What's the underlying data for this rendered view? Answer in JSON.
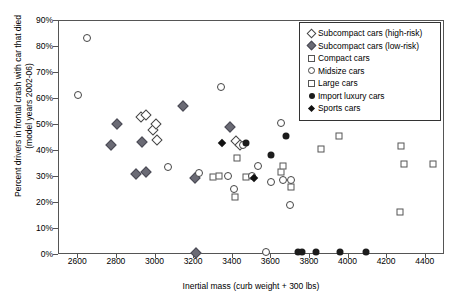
{
  "chart_data": {
    "type": "scatter",
    "title": "",
    "xlabel": "Inertial mass (curb weight + 300 lbs)",
    "ylabel": "Percent drivers in frontal crash with car that died\n(model years 2002-06)",
    "xlim": [
      2500,
      4500
    ],
    "ylim": [
      0,
      0.9
    ],
    "grid": false,
    "legend_position": "top-right",
    "xticks": [
      "2600",
      "2800",
      "3000",
      "3200",
      "3400",
      "3600",
      "3800",
      "4000",
      "4200",
      "4400"
    ],
    "xtick_values": [
      2600,
      2800,
      3000,
      3200,
      3400,
      3600,
      3800,
      4000,
      4200,
      4400
    ],
    "yticks": [
      "0%",
      "10%",
      "20%",
      "30%",
      "40%",
      "50%",
      "60%",
      "70%",
      "80%",
      "90%"
    ],
    "ytick_values": [
      0,
      10,
      20,
      30,
      40,
      50,
      60,
      70,
      80,
      90
    ],
    "series": [
      {
        "name": "Subcompact cars (high-risk)",
        "marker": "open-diamond",
        "marker_class": "m-odia",
        "legend_class": "s-odia",
        "points": [
          [
            2925,
            53.0
          ],
          [
            2950,
            54.0
          ],
          [
            2985,
            48.0
          ],
          [
            3000,
            50.3
          ],
          [
            3010,
            44.3
          ],
          [
            3415,
            43.8
          ],
          [
            3440,
            42.2
          ]
        ]
      },
      {
        "name": "Subcompact cars (low-risk)",
        "marker": "filled-diamond-gray",
        "marker_class": "m-fdia",
        "legend_class": "s-fdia",
        "points": [
          [
            2770,
            42.5
          ],
          [
            2800,
            50.2
          ],
          [
            2900,
            31.2
          ],
          [
            2930,
            43.4
          ],
          [
            2950,
            31.8
          ],
          [
            3140,
            57.2
          ],
          [
            3205,
            29.8
          ],
          [
            3385,
            49.4
          ],
          [
            3210,
            0.7
          ]
        ]
      },
      {
        "name": "Compact cars",
        "marker": "open-square-small",
        "marker_class": "m-sqs",
        "legend_class": "s-sq",
        "points": [
          [
            3300,
            30.0
          ],
          [
            3330,
            30.3
          ],
          [
            3410,
            22.5
          ],
          [
            3420,
            37.2
          ],
          [
            3470,
            30.1
          ],
          [
            3650,
            31.8
          ],
          [
            3660,
            34.3
          ],
          [
            3700,
            26.0
          ]
        ]
      },
      {
        "name": "Midsize cars",
        "marker": "open-circle",
        "marker_class": "m-ocir",
        "legend_class": "s-ocir",
        "points": [
          [
            2645,
            83.4
          ],
          [
            2600,
            61.5
          ],
          [
            3065,
            33.8
          ],
          [
            3225,
            31.5
          ],
          [
            3340,
            64.8
          ],
          [
            3375,
            30.5
          ],
          [
            3405,
            25.4
          ],
          [
            3455,
            42.5
          ],
          [
            3530,
            34.2
          ],
          [
            3600,
            27.9
          ],
          [
            3650,
            50.9
          ],
          [
            3660,
            28.7
          ],
          [
            3700,
            28.8
          ],
          [
            3695,
            19.4
          ],
          [
            3570,
            1.0
          ],
          [
            3500,
            30.2
          ]
        ]
      },
      {
        "name": "Large cars",
        "marker": "open-square",
        "marker_class": "m-sql",
        "legend_class": "s-sq",
        "points": [
          [
            3860,
            40.6
          ],
          [
            3950,
            45.9
          ],
          [
            4270,
            41.8
          ],
          [
            4290,
            34.9
          ],
          [
            4440,
            34.9
          ],
          [
            4265,
            16.5
          ]
        ]
      },
      {
        "name": "Import luxury cars",
        "marker": "filled-circle",
        "marker_class": "m-fcir",
        "legend_class": "s-fcir",
        "points": [
          [
            3470,
            43.0
          ],
          [
            3600,
            38.5
          ],
          [
            3675,
            45.6
          ],
          [
            3740,
            1.0
          ],
          [
            3830,
            1.0
          ],
          [
            3955,
            1.0
          ],
          [
            4090,
            1.0
          ],
          [
            3760,
            1.0
          ]
        ]
      },
      {
        "name": "Sports cars",
        "marker": "filled-diamond",
        "marker_class": "m-spdia",
        "legend_class": "s-spdia",
        "points": [
          [
            3345,
            43.0
          ],
          [
            3510,
            29.6
          ]
        ]
      }
    ]
  }
}
